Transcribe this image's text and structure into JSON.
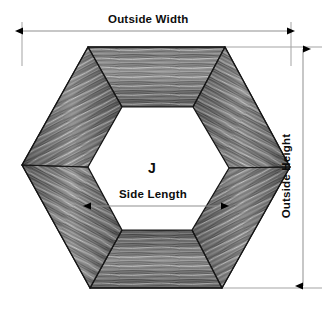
{
  "diagram": {
    "labels": {
      "outside_width": "Outside Width",
      "outside_height": "Outside Height",
      "side_length": "Side Length",
      "interior": "J"
    },
    "colors": {
      "background": "#ffffff",
      "line": "#9a9a9a",
      "arrow": "#000000",
      "text": "#0d0d0d",
      "wood_dark": "#4a4a4a",
      "wood_mid": "#7e7e7e",
      "wood_light": "#b4b4b4",
      "wood_highlight": "#d2d2d2",
      "edge_stroke": "#1a1a1a"
    },
    "geometry": {
      "outer_hexagon": [
        [
          88,
          47
        ],
        [
          225,
          47
        ],
        [
          290,
          167
        ],
        [
          222,
          288
        ],
        [
          90,
          288
        ],
        [
          22,
          165
        ]
      ],
      "inner_hexagon": [
        [
          122,
          107
        ],
        [
          193,
          107
        ],
        [
          229,
          168
        ],
        [
          192,
          230
        ],
        [
          122,
          230
        ],
        [
          88,
          167
        ]
      ],
      "miter_joints": [
        [
          [
            88,
            47
          ],
          [
            122,
            107
          ]
        ],
        [
          [
            225,
            47
          ],
          [
            193,
            107
          ]
        ],
        [
          [
            290,
            167
          ],
          [
            229,
            168
          ]
        ],
        [
          [
            222,
            288
          ],
          [
            192,
            230
          ]
        ],
        [
          [
            90,
            288
          ],
          [
            122,
            230
          ]
        ],
        [
          [
            22,
            165
          ],
          [
            88,
            167
          ]
        ]
      ]
    },
    "dimension_lines": {
      "outside_width": {
        "y": 31,
        "x_start": 22,
        "x_end": 288,
        "arrows": "both"
      },
      "outside_height": {
        "x": 303,
        "y_start": 48,
        "y_end": 288,
        "arrows": "both"
      },
      "side_length": {
        "y": 206,
        "x_start": 90,
        "x_end": 222,
        "arrows": "both"
      }
    },
    "extension_lines": [
      {
        "name": "left-vertical",
        "x1": 22,
        "y1": 22,
        "x2": 22,
        "y2": 62
      },
      {
        "name": "right-vertical",
        "x1": 291,
        "y1": 22,
        "x2": 291,
        "y2": 62
      },
      {
        "name": "top-horizontal",
        "x1": 225,
        "y1": 47,
        "x2": 320,
        "y2": 47
      },
      {
        "name": "bottom-horizontal",
        "x1": 222,
        "y1": 288,
        "x2": 320,
        "y2": 288
      }
    ]
  }
}
